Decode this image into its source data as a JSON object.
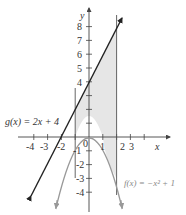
{
  "figure": {
    "axes": {
      "x_label": "x",
      "y_label": "y",
      "x_ticks": [
        {
          "v": -4,
          "label": "-4"
        },
        {
          "v": -3,
          "label": "-3"
        },
        {
          "v": -2,
          "label": "-2"
        },
        {
          "v": -1,
          "label": "-1"
        },
        {
          "v": 0,
          "label": "0"
        },
        {
          "v": 1,
          "label": "1"
        },
        {
          "v": 2,
          "label": "2"
        },
        {
          "v": 3,
          "label": "3"
        },
        {
          "v": 4,
          "label": ""
        }
      ],
      "y_ticks": [
        {
          "v": 8,
          "label": "8"
        },
        {
          "v": 7,
          "label": "7"
        },
        {
          "v": 6,
          "label": "6"
        },
        {
          "v": 5,
          "label": "5"
        },
        {
          "v": 4,
          "label": "4"
        },
        {
          "v": 3,
          "label": ""
        },
        {
          "v": 2,
          "label": ""
        },
        {
          "v": 1,
          "label": ""
        },
        {
          "v": -1,
          "label": ""
        },
        {
          "v": -2,
          "label": "-2"
        },
        {
          "v": -3,
          "label": "-3"
        },
        {
          "v": -4,
          "label": "-4"
        }
      ]
    },
    "curves": {
      "g": {
        "label": "g(x) = 2x + 4",
        "color": "#222222"
      },
      "f": {
        "label": "f(x) = −x² + 1",
        "color": "#999999"
      }
    },
    "region": {
      "x_from": -1,
      "x_to": 2,
      "fill": "#e6e6e6"
    }
  }
}
